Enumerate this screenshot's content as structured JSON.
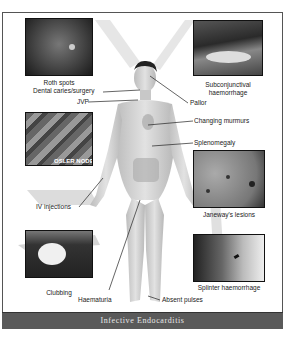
{
  "title": "Infective Endocarditis",
  "colors": {
    "footer_bg": "#5a5a5a",
    "footer_text": "#e8e8e8",
    "frame_border": "#555555",
    "label_text": "#222222",
    "skin": "#cfcfcf"
  },
  "photos": [
    {
      "id": "roth-spots",
      "caption": "Roth spots"
    },
    {
      "id": "subconjunctival-haemorrhage",
      "caption_line1": "Subconjunctival",
      "caption_line2": "haemorrhage"
    },
    {
      "id": "osler-nodes",
      "caption": "OSLER NODES"
    },
    {
      "id": "janeways-lesions",
      "caption": "Janeway's lesions"
    },
    {
      "id": "clubbing",
      "caption": "Clubbing"
    },
    {
      "id": "splinter-haemorrhage",
      "caption": "Splinter haemorrhage"
    }
  ],
  "body_labels": {
    "dental": "Dental caries/surgery",
    "jvp": "JVP",
    "pallor": "Pallor",
    "murmurs": "Changing murmurs",
    "spleno": "Splenomegaly",
    "iv": "IV injections",
    "haematuria": "Haematuria",
    "pulses": "Absent pulses"
  }
}
